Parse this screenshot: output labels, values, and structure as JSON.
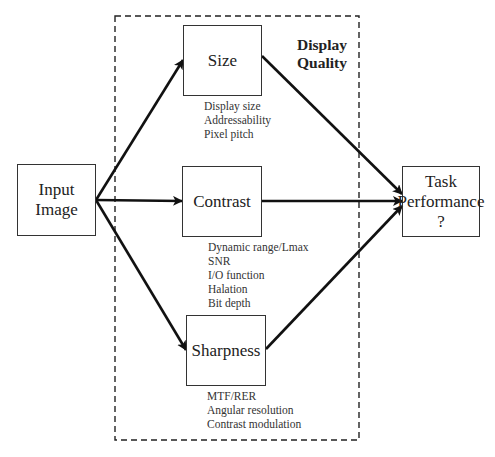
{
  "diagram": {
    "group": {
      "title_line1": "Display",
      "title_line2": "Quality"
    },
    "nodes": {
      "input": {
        "label": "Input\nImage"
      },
      "size": {
        "label": "Size",
        "attributes": [
          "Display size",
          "Addressability",
          "Pixel pitch"
        ]
      },
      "contrast": {
        "label": "Contrast",
        "attributes": [
          "Dynamic range/Lmax",
          "SNR",
          "I/O function",
          "Halation",
          "Bit depth"
        ]
      },
      "sharpness": {
        "label": "Sharpness",
        "attributes": [
          "MTF/RER",
          "Angular resolution",
          "Contrast modulation"
        ]
      },
      "output": {
        "label": "Task\nPerformance\n?"
      }
    },
    "edges": [
      {
        "from": "input",
        "to": "size"
      },
      {
        "from": "input",
        "to": "contrast"
      },
      {
        "from": "input",
        "to": "sharpness"
      },
      {
        "from": "size",
        "to": "output"
      },
      {
        "from": "contrast",
        "to": "output"
      },
      {
        "from": "sharpness",
        "to": "output"
      }
    ]
  }
}
